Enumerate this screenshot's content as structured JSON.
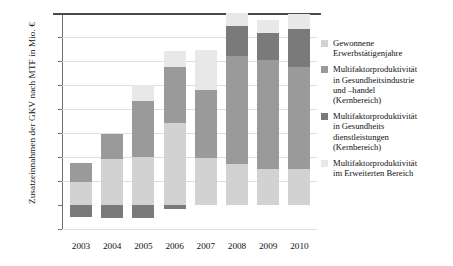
{
  "chart_data": {
    "type": "bar",
    "stacked": true,
    "title": "",
    "xlabel": "",
    "ylabel": "Zusatzeinnahmen der GKV nach MTF in Mio. €",
    "ylim": [
      -200,
      1600
    ],
    "yticks": [
      -200,
      0,
      200,
      400,
      600,
      800,
      1000,
      1200,
      1400,
      1600
    ],
    "ytick_labels": [
      "-200",
      "0",
      "200",
      "400",
      "600",
      "800",
      "1.000",
      "1.200",
      "1.400",
      "1.600"
    ],
    "categories": [
      "2003",
      "2004",
      "2005",
      "2006",
      "2007",
      "2008",
      "2009",
      "2010"
    ],
    "grid": true,
    "legend_position": "right",
    "series": [
      {
        "name": "Gewonnene Erwerbstätigenjahre",
        "color": "#d2d2d2",
        "values": [
          190,
          380,
          400,
          680,
          395,
          340,
          300,
          300
        ]
      },
      {
        "name": "Multifaktorproduktivität in Gesundheitsindustrie und -handel (Kernbereich)",
        "color": "#9a9a9a",
        "values": [
          160,
          210,
          470,
          470,
          565,
          900,
          905,
          850
        ]
      },
      {
        "name": "Multifaktorproduktivität in Gesundheitsdienstleistungen (Kernbereich)",
        "color": "#7a7a7a",
        "values": [
          0,
          0,
          0,
          0,
          0,
          250,
          225,
          315
        ]
      },
      {
        "name": "Multifaktorproduktivität im Erweiterten Bereich",
        "color": "#e8e8e8",
        "values": [
          0,
          0,
          130,
          130,
          335,
          110,
          110,
          125
        ]
      }
    ],
    "negative_series": {
      "name": "Multifaktorproduktivität in Gesundheitsdienstleistungen (Kernbereich)",
      "color": "#7a7a7a",
      "values": [
        -100,
        -105,
        -110,
        -30,
        0,
        0,
        0,
        0
      ]
    },
    "totals": [
      350,
      590,
      1000,
      1280,
      1295,
      1500,
      1520,
      1530
    ]
  },
  "legend": {
    "items": [
      {
        "label": "Gewonnene\nErwerbstätigenjahre",
        "color": "#d2d2d2"
      },
      {
        "label": "Multifaktorproduktivität\nin Gesundheitsindustrie\nund –handel\n(Kernbereich)",
        "color": "#9a9a9a"
      },
      {
        "label": "Multifaktorproduktivität\nin Gesundheits­\ndienstleistungen\n(Kernbereich)",
        "color": "#7a7a7a"
      },
      {
        "label": "Multifaktorproduktivität\nim Erweiterten Bereich",
        "color": "#e8e8e8"
      }
    ]
  }
}
